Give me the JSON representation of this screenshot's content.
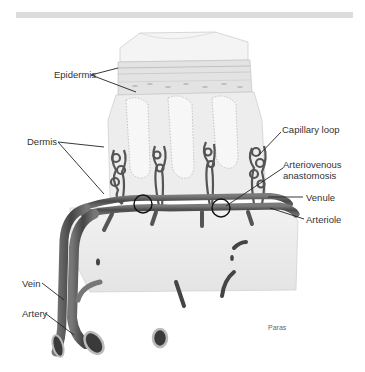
{
  "figure": {
    "type": "anatomical-illustration",
    "credit": "Paras"
  },
  "labels": {
    "epidermis": "Epidermis",
    "dermis": "Dermis",
    "capillary_loop": "Capillary loop",
    "arteriovenous_1": "Arteriovenous",
    "arteriovenous_2": "anastomosis",
    "venule": "Venule",
    "arteriole": "Arteriole",
    "vein": "Vein",
    "artery": "Artery"
  },
  "colors": {
    "vessel": "#5a5a5a",
    "vessel_light": "#8a8a8a",
    "tissue": "#ececec",
    "epidermis": "#d9d9d9",
    "leader_line": "#222222",
    "topbar": "#dcdcdc"
  }
}
